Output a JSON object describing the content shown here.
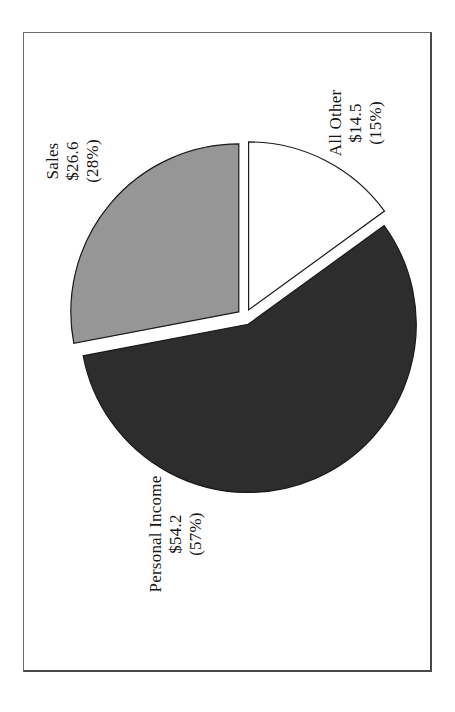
{
  "page": {
    "background": "#ffffff"
  },
  "frame": {
    "border_color": "#4a4a4a"
  },
  "chart_data": {
    "type": "pie",
    "title": "",
    "exploded": true,
    "rotation_deg": -90,
    "start_angle_deg_from_12oclock": 0,
    "direction": "clockwise",
    "stroke_color": "#1a1a1a",
    "slices": [
      {
        "name": "All Other",
        "value": 14.5,
        "pct": 15,
        "color": "#ffffff",
        "label_lines": [
          "All Other",
          "$14.5",
          "(15%)"
        ]
      },
      {
        "name": "Personal Income",
        "value": 54.2,
        "pct": 57,
        "color": "#2d2d2d",
        "label_lines": [
          "Personal Income",
          "$54.2",
          "(57%)"
        ]
      },
      {
        "name": "Sales",
        "value": 26.6,
        "pct": 28,
        "color": "#969696",
        "label_lines": [
          "Sales",
          "$26.6",
          "(28%)"
        ]
      }
    ]
  }
}
